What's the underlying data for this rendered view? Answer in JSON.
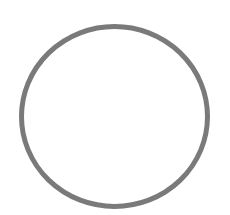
{
  "shape": {
    "type": "circle-outline",
    "cx": 114.5,
    "cy": 116.5,
    "rx": 93,
    "ry": 90,
    "stroke_width": 5,
    "stroke_color": "#7a7a7a",
    "fill_color": "#ffffff"
  },
  "background_color": "#ffffff"
}
